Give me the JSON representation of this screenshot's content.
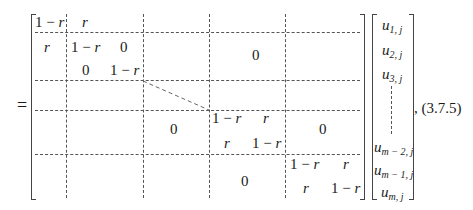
{
  "equation": {
    "equals_sign": "=",
    "label": ", (3.7.5)",
    "matrix": {
      "block_1": {
        "r1c1": "1 − r",
        "r1c2": "r"
      },
      "block_2": {
        "r1c1": "r",
        "r1c2": "1 − r",
        "r1c3": "0",
        "r2c2": "0",
        "r2c3": "1 − r"
      },
      "upper_zero": "0",
      "middle_block": {
        "r1c1": "1 − r",
        "r1c2": "r",
        "r2c1": "r",
        "r2c2": "1 − r"
      },
      "middle_left_zero": "0",
      "middle_right_zero": "0",
      "last_block": {
        "r1c1": "1 − r",
        "r1c2": "r",
        "r2c1": "r",
        "r2c2": "1 − r"
      },
      "lower_zero": "0"
    },
    "vector": {
      "entries": [
        {
          "base": "u",
          "sub": "1, j"
        },
        {
          "base": "u",
          "sub": "2, j"
        },
        {
          "base": "u",
          "sub": "3, j"
        },
        {
          "base": "u",
          "sub": "m − 2, j"
        },
        {
          "base": "u",
          "sub": "m − 1, j"
        },
        {
          "base": "u",
          "sub": "m, j"
        }
      ]
    }
  }
}
